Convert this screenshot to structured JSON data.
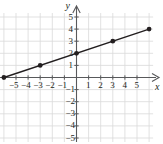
{
  "chart_data": {
    "type": "line",
    "title": "",
    "xlabel": "x",
    "ylabel": "y",
    "xlim": [
      -6.8,
      6.6
    ],
    "ylim": [
      -5.6,
      5.9
    ],
    "grid": true,
    "grid_step": 1,
    "legend": "none",
    "series": [
      {
        "name": "line",
        "equation": "y = (1/3)x + 2",
        "slope": 0.3333,
        "intercept": 2,
        "x": [
          -6,
          -3,
          0,
          3,
          6
        ],
        "values": [
          0,
          1,
          2,
          3,
          4
        ],
        "points": [
          [
            -6,
            0
          ],
          [
            -3,
            1
          ],
          [
            0,
            2
          ],
          [
            3,
            3
          ],
          [
            6,
            4
          ]
        ],
        "marker": "filled-circle",
        "color": "#231f20"
      }
    ],
    "xticks": [
      -5,
      -4,
      -3,
      -2,
      -1,
      1,
      2,
      3,
      4,
      5
    ],
    "yticks": [
      5,
      4,
      3,
      2,
      1,
      -1,
      -2,
      -3,
      -4,
      -5
    ],
    "xtick_labels": [
      "-5",
      "-4",
      "-3",
      "-2",
      "-1",
      "1",
      "2",
      "3",
      "4",
      "5"
    ],
    "ytick_labels": [
      "5",
      "4",
      "3",
      "2",
      "1",
      "-1",
      "-2",
      "-3",
      "-4",
      "-5"
    ],
    "grid_color": "#d9d9d9",
    "axis_color": "#58595b",
    "bg_color": "#ffffff"
  },
  "axes": {
    "x_axis_label": "x",
    "y_axis_label": "y",
    "x_ticks": [
      {
        "value": -5,
        "label": "−5"
      },
      {
        "value": -4,
        "label": "−4"
      },
      {
        "value": -3,
        "label": "−3"
      },
      {
        "value": -2,
        "label": "−2"
      },
      {
        "value": -1,
        "label": "−1"
      },
      {
        "value": 1,
        "label": "1"
      },
      {
        "value": 2,
        "label": "2"
      },
      {
        "value": 3,
        "label": "3"
      },
      {
        "value": 4,
        "label": "4"
      },
      {
        "value": 5,
        "label": "5"
      }
    ],
    "y_ticks": [
      {
        "value": 5,
        "label": "5"
      },
      {
        "value": 4,
        "label": "4"
      },
      {
        "value": 3,
        "label": "3"
      },
      {
        "value": 2,
        "label": "2"
      },
      {
        "value": 1,
        "label": "1"
      },
      {
        "value": -1,
        "label": "−1"
      },
      {
        "value": -2,
        "label": "−2"
      },
      {
        "value": -3,
        "label": "−3"
      },
      {
        "value": -4,
        "label": "−4"
      },
      {
        "value": -5,
        "label": "−5"
      }
    ]
  }
}
